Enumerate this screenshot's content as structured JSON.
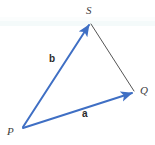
{
  "figure": {
    "type": "vector-triangle-diagram",
    "background_color": "#ffffff",
    "vector_color": "#3f6fc4",
    "plain_line_color": "#555555",
    "label_color": "#3c3c3c"
  },
  "vertices": [
    {
      "name": "S",
      "label": "S",
      "x": 90,
      "y": 22
    },
    {
      "name": "Q",
      "label": "Q",
      "x": 135,
      "y": 92
    },
    {
      "name": "P",
      "label": "P",
      "x": 22,
      "y": 128
    }
  ],
  "vectors": [
    {
      "name": "b",
      "label": "b",
      "from": "P",
      "to": "S",
      "color": "#3f6fc4",
      "arrow": true
    },
    {
      "name": "a",
      "label": "a",
      "from": "P",
      "to": "Q",
      "color": "#3f6fc4",
      "arrow": true
    }
  ],
  "segments": [
    {
      "name": "SQ",
      "from": "S",
      "to": "Q",
      "color": "#555555",
      "arrow": false
    }
  ],
  "labels": {
    "vertex_S": "S",
    "vertex_Q": "Q",
    "vertex_P": "P",
    "vector_b": "b",
    "vector_a": "a"
  }
}
